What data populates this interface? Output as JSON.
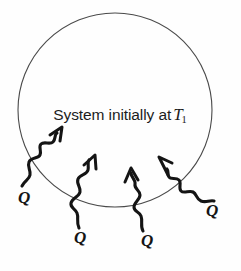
{
  "figure": {
    "background_color": "#fefefe",
    "ink_color": "#141414",
    "circle_stroke_color": "#4a4a4a",
    "system_label": {
      "text_prefix": "System initially at",
      "temperature_symbol": "T",
      "temperature_subscript": "1",
      "full_text": "System initially at T1"
    },
    "circle": {
      "center_x": 115,
      "center_y": 110,
      "radius": 97,
      "stroke_width": 1
    },
    "heat_arrows": [
      {
        "id": "heat-arrow-left",
        "label": "Q",
        "label_x": 18,
        "label_y": 192,
        "tail_x": 22,
        "tail_y": 185,
        "head_x": 63,
        "head_y": 145,
        "direction": "up-right"
      },
      {
        "id": "heat-arrow-mid-left",
        "label": "Q",
        "label_x": 74,
        "label_y": 232,
        "tail_x": 78,
        "tail_y": 228,
        "head_x": 95,
        "head_y": 168,
        "direction": "up"
      },
      {
        "id": "heat-arrow-mid-right",
        "label": "Q",
        "label_x": 140,
        "label_y": 235,
        "tail_x": 143,
        "tail_y": 230,
        "head_x": 131,
        "head_y": 178,
        "direction": "up"
      },
      {
        "id": "heat-arrow-right",
        "label": "Q",
        "label_x": 205,
        "label_y": 205,
        "tail_x": 213,
        "tail_y": 203,
        "head_x": 160,
        "head_y": 157,
        "direction": "up-left"
      }
    ]
  }
}
